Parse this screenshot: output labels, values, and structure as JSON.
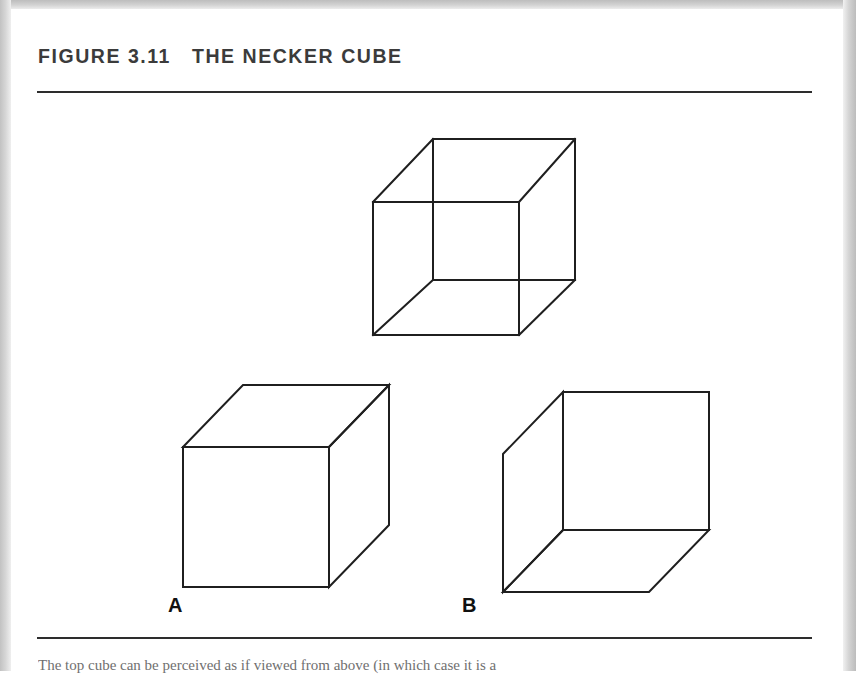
{
  "page": {
    "background_color": "#ffffff",
    "scan_border_color": "#c8c8c8",
    "ink_color": "#2d2d2d"
  },
  "figure": {
    "number_label": "FIGURE 3.11",
    "title_text": "FIGURE 3.11   THE NECKER CUBE",
    "title": "THE NECKER CUBE",
    "title_color": "#3b3b3b",
    "caption": "The top cube can be perceived as if viewed from above (in which case it is a",
    "rule_top_present": "true",
    "rule_bottom_present": "true"
  },
  "panels": [
    {
      "id": "necker-cube",
      "label": "",
      "description": "Ambiguous wireframe Necker cube with all twelve edges drawn and no hidden-line removal",
      "kind": "wireframe"
    },
    {
      "id": "cube-a",
      "label": "A",
      "description": "Opaque cube interpretation seen from above: top face, front face and right face visible",
      "kind": "opaque-from-above"
    },
    {
      "id": "cube-b",
      "label": "B",
      "description": "Opaque cube interpretation seen from below: bottom face, left face and back face visible",
      "kind": "opaque-from-below"
    }
  ],
  "geometry": {
    "necker": {
      "front_square": {
        "left": 362,
        "top": 193,
        "right": 508,
        "bottom": 326
      },
      "back_square": {
        "left": 422,
        "top": 130,
        "right": 564,
        "bottom": 271
      },
      "stroke_width": 2
    },
    "cube_a": {
      "front_square": {
        "left": 172,
        "top": 438,
        "right": 318,
        "bottom": 578
      },
      "offset_x": 60,
      "offset_y": -62
    },
    "cube_b": {
      "back_square": {
        "left": 551,
        "top": 383,
        "right": 697,
        "bottom": 521
      },
      "offset_x": -60,
      "offset_y": 62
    }
  }
}
